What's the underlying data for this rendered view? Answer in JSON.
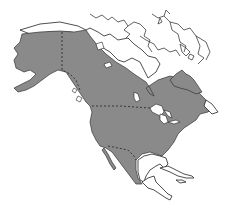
{
  "map": {
    "subject": "North America range map",
    "region": "North America",
    "colors": {
      "background": "#ffffff",
      "range_fill": "#8a8a8a",
      "outline": "#222222"
    },
    "legend": null,
    "labels": []
  }
}
